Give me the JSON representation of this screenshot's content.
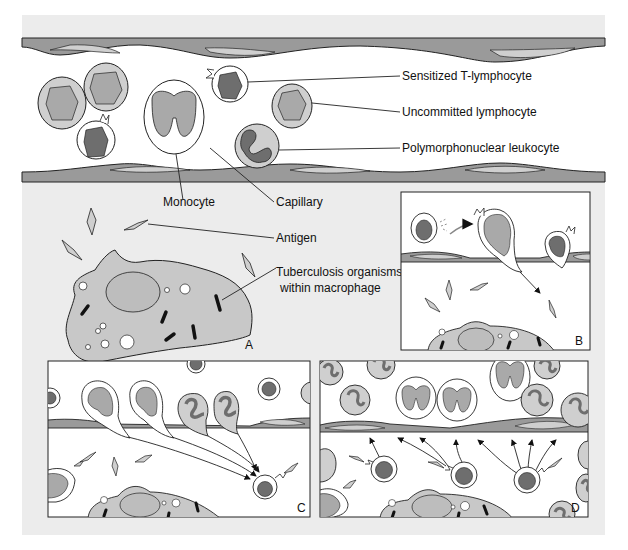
{
  "figure": {
    "colors": {
      "page_background": "#ffffff",
      "panel_background": "#ececec",
      "cell_interior": "#ffffff",
      "light_fill": "#c8c8c8",
      "medium_fill": "#a9a9a9",
      "dark_fill": "#6e6e6e",
      "vessel_wall": "#9a9a9a",
      "outline": "#222222"
    }
  },
  "labels": {
    "sensitized_t_lymphocyte": "Sensitized T-lymphocyte",
    "uncommitted_lymphocyte": "Uncommitted lymphocyte",
    "polymorphonuclear_leukocyte": "Polymorphonuclear leukocyte",
    "monocyte": "Monocyte",
    "capillary": "Capillary",
    "antigen": "Antigen",
    "tb_organisms_line1": "Tuberculosis organisms",
    "tb_organisms_line2": "within macrophage"
  },
  "panels": [
    {
      "id": "A",
      "letter": "A"
    },
    {
      "id": "B",
      "letter": "B"
    },
    {
      "id": "C",
      "letter": "C"
    },
    {
      "id": "D",
      "letter": "D"
    }
  ]
}
